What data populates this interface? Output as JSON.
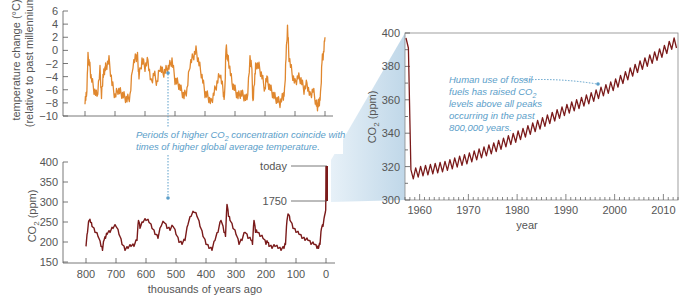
{
  "chart_data": [
    {
      "type": "line",
      "title": "",
      "xlabel": "",
      "ylabel": "temperature change (°C)",
      "ylabel_line2": "(relative to past millennium)",
      "ylim": [
        -10,
        6
      ],
      "yticks": [
        "6",
        "4",
        "2",
        "0",
        "-2",
        "-4",
        "-6",
        "-8",
        "-10"
      ],
      "xlim": [
        800,
        0
      ],
      "x_direction": "reversed",
      "grid": false,
      "color": "#e0872e",
      "series": [
        {
          "name": "temperature change",
          "x": [
            800,
            795,
            790,
            785,
            780,
            770,
            760,
            750,
            745,
            740,
            735,
            730,
            720,
            710,
            700,
            690,
            680,
            670,
            660,
            650,
            640,
            630,
            625,
            620,
            610,
            600,
            590,
            580,
            570,
            560,
            550,
            540,
            530,
            520,
            510,
            500,
            490,
            480,
            470,
            460,
            450,
            440,
            430,
            420,
            410,
            400,
            390,
            380,
            370,
            360,
            350,
            340,
            335,
            330,
            325,
            320,
            310,
            300,
            290,
            280,
            270,
            260,
            250,
            245,
            240,
            235,
            230,
            220,
            210,
            200,
            195,
            190,
            180,
            170,
            160,
            150,
            140,
            135,
            130,
            125,
            120,
            110,
            100,
            90,
            80,
            70,
            60,
            50,
            40,
            30,
            25,
            20,
            15,
            10,
            5,
            0
          ],
          "values": [
            -7.5,
            -7,
            -1,
            -2,
            -4,
            -6,
            -7,
            -3,
            -7,
            -4,
            -3,
            -2.5,
            -1.5,
            -5,
            -7,
            -6,
            -6.5,
            -7,
            -7.5,
            -7,
            -2,
            -1,
            -1,
            -4,
            -1.5,
            -2.5,
            -1.5,
            -5,
            -3.5,
            -5,
            -2.5,
            -3.5,
            -3,
            -2.5,
            -1.5,
            -4.5,
            -5,
            -6,
            -7,
            -6,
            -2,
            -1,
            0,
            -2,
            -4,
            -6.5,
            -7,
            -8,
            -6.5,
            -5,
            -3.5,
            -6,
            -7.5,
            0.5,
            -1,
            -2,
            -5,
            -6,
            -7,
            -6.5,
            -7,
            -7.5,
            -1.5,
            -2,
            -8,
            -4.5,
            -2,
            -2.5,
            -4,
            -6,
            -4,
            -5,
            -6,
            -7,
            -7.5,
            -8,
            -7,
            -6.5,
            -1,
            3.5,
            -1,
            -3.5,
            -5,
            -4,
            -4.5,
            -6,
            -5,
            -7,
            -6,
            -8,
            -8.5,
            -8,
            -7,
            -1.5,
            -0.5,
            2
          ]
        }
      ]
    },
    {
      "type": "line",
      "title": "",
      "xlabel": "thousands of years ago",
      "ylabel": "CO2 (ppm)",
      "ylim": [
        150,
        400
      ],
      "yticks": [
        "400",
        "350",
        "300",
        "250",
        "200",
        "150"
      ],
      "xticks": [
        "800",
        "700",
        "600",
        "500",
        "400",
        "300",
        "200",
        "100",
        "0"
      ],
      "xlim": [
        800,
        0
      ],
      "x_direction": "reversed",
      "grid": false,
      "color": "#7a1a1a",
      "annotations": [
        "today",
        "1750"
      ],
      "series": [
        {
          "name": "CO2 concentration",
          "x": [
            800,
            795,
            790,
            785,
            780,
            770,
            760,
            750,
            745,
            740,
            735,
            730,
            720,
            710,
            700,
            690,
            680,
            670,
            660,
            650,
            640,
            630,
            625,
            620,
            610,
            600,
            590,
            580,
            570,
            560,
            550,
            540,
            530,
            520,
            510,
            500,
            490,
            480,
            470,
            460,
            450,
            440,
            430,
            420,
            410,
            400,
            390,
            380,
            370,
            360,
            350,
            340,
            335,
            330,
            325,
            320,
            310,
            300,
            290,
            280,
            270,
            260,
            250,
            245,
            240,
            235,
            230,
            220,
            210,
            200,
            195,
            190,
            180,
            170,
            160,
            150,
            140,
            135,
            130,
            125,
            120,
            110,
            100,
            90,
            80,
            70,
            60,
            50,
            40,
            30,
            25,
            20,
            15,
            10,
            5,
            2,
            1,
            0.5,
            0
          ],
          "values": [
            195,
            230,
            260,
            255,
            245,
            230,
            220,
            195,
            185,
            210,
            215,
            225,
            230,
            240,
            245,
            225,
            200,
            185,
            190,
            195,
            195,
            210,
            260,
            240,
            255,
            260,
            255,
            240,
            225,
            215,
            245,
            255,
            240,
            235,
            245,
            225,
            205,
            200,
            210,
            250,
            270,
            280,
            270,
            245,
            220,
            200,
            190,
            185,
            210,
            230,
            260,
            230,
            220,
            300,
            270,
            260,
            240,
            225,
            200,
            210,
            230,
            215,
            210,
            200,
            260,
            230,
            230,
            220,
            215,
            200,
            205,
            195,
            190,
            195,
            190,
            185,
            190,
            200,
            260,
            275,
            260,
            240,
            230,
            225,
            215,
            210,
            210,
            200,
            200,
            190,
            190,
            200,
            240,
            245,
            265,
            275,
            280,
            340,
            390
          ]
        }
      ]
    },
    {
      "type": "line",
      "title": "",
      "xlabel": "year",
      "ylabel": "CO2 (ppm)",
      "ylim": [
        300,
        400
      ],
      "xlim": [
        1957,
        2013
      ],
      "yticks": [
        "400",
        "380",
        "360",
        "340",
        "320",
        "300"
      ],
      "xticks": [
        "1960",
        "1970",
        "1980",
        "1990",
        "2000",
        "2010"
      ],
      "grid": false,
      "color": "#7a1a1a",
      "series": [
        {
          "name": "Mauna Loa CO2 (seasonal cycle)",
          "x": [
            1958,
            1960,
            1965,
            1970,
            1975,
            1980,
            1985,
            1990,
            1995,
            2000,
            2005,
            2010,
            2012
          ],
          "values": [
            315,
            317,
            320,
            325,
            331,
            338,
            346,
            354,
            361,
            369,
            380,
            389,
            394
          ]
        }
      ]
    }
  ],
  "annotations": {
    "center_line1": "Periods of higher CO",
    "center_sub": "2",
    "center_line1b": " concentration coincide with",
    "center_line2": "times of higher global average temperature.",
    "right_line1": "Human use of fossil",
    "right_line2a": "fuels has raised CO",
    "right_sub": "2",
    "right_line3": "levels above all peaks",
    "right_line4": "occurring in the past",
    "right_line5": "800,000 years.",
    "today": "today",
    "y1750": "1750"
  },
  "labels": {
    "temp_ylabel_1": "temperature change (°C)",
    "temp_ylabel_2": "(relative to past millennium)",
    "co2_ylabel_main": "CO",
    "co2_ylabel_sub": "2",
    "co2_ylabel_unit": " (ppm)",
    "bottom_xlabel": "thousands of years ago",
    "right_xlabel": "year",
    "right_ylabel_main": "CO",
    "right_ylabel_sub": "2",
    "right_ylabel_unit": " (ppm)"
  },
  "colors": {
    "temperature": "#e0872e",
    "co2": "#7a1a1a",
    "annotation": "#5b9ec9",
    "zoom_wedge": "#c7dceb",
    "axis": "#555555"
  }
}
